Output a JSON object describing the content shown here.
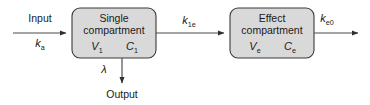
{
  "diagram": {
    "background_color": "#ffffff",
    "box_fill_color": "#d9d9d9",
    "box_stroke_color": "#3a3a3a",
    "line_color": "#4a4a4a",
    "text_color": "#1a1a1a"
  },
  "boxes": [
    {
      "id": "single-compartment",
      "title_line1": "Single",
      "title_line2": "compartment",
      "volume_symbol": "V",
      "volume_subscript": "1",
      "concentration_symbol": "C",
      "concentration_subscript": "1"
    },
    {
      "id": "effect-compartment",
      "title_line1": "Effect",
      "title_line2": "compartment",
      "volume_symbol": "V",
      "volume_subscript": "e",
      "concentration_symbol": "C",
      "concentration_subscript": "e"
    }
  ],
  "edges": {
    "input": {
      "label": "Input",
      "rate_symbol": "k",
      "rate_subscript": "a"
    },
    "transfer": {
      "rate_symbol": "k",
      "rate_subscript": "1e"
    },
    "elimination": {
      "rate_symbol": "λ",
      "target_label": "Output"
    },
    "effect_out": {
      "rate_symbol": "k",
      "rate_subscript": "e0"
    }
  }
}
